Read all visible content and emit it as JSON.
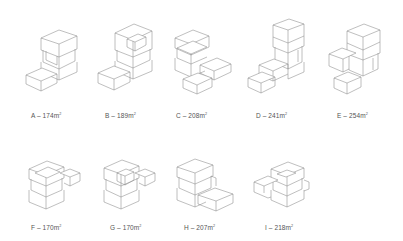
{
  "figure": {
    "unit_suffix": "m",
    "unit_exponent": "2",
    "line_color": "#8a8a8a",
    "label_color": "#555555",
    "background": "#ffffff"
  },
  "variants": [
    {
      "letter": "A",
      "separator": " – ",
      "area": "174",
      "label": "A – 174m²"
    },
    {
      "letter": "B",
      "separator": " – ",
      "area": "189",
      "label": "B – 189m²"
    },
    {
      "letter": "C",
      "separator": " – ",
      "area": "208",
      "label": "C – 208m²"
    },
    {
      "letter": "D",
      "separator": " – ",
      "area": "241",
      "label": "D – 241m²"
    },
    {
      "letter": "E",
      "separator": " – ",
      "area": "254",
      "label": "E – 254m²"
    },
    {
      "letter": "F",
      "separator": " – ",
      "area": "170",
      "label": "F – 170m²"
    },
    {
      "letter": "G",
      "separator": " – ",
      "area": "170",
      "label": "G – 170m²"
    },
    {
      "letter": "H",
      "separator": " – ",
      "area": "207",
      "label": "H – 207m²"
    },
    {
      "letter": "I",
      "separator": " – ",
      "area": "218",
      "label": "I – 218m²"
    }
  ]
}
